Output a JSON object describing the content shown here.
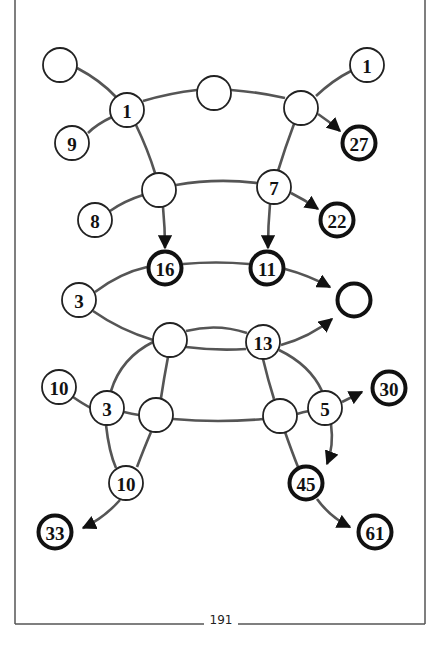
{
  "page": {
    "number": "191"
  },
  "diagram": {
    "type": "graph",
    "nodes": [
      {
        "id": "a",
        "label": "",
        "style": "normal",
        "x": 60,
        "y": 65
      },
      {
        "id": "b",
        "label": "1",
        "style": "normal",
        "x": 127,
        "y": 110
      },
      {
        "id": "c",
        "label": "",
        "style": "normal",
        "x": 214,
        "y": 93
      },
      {
        "id": "d",
        "label": "1",
        "style": "normal",
        "x": 367,
        "y": 65
      },
      {
        "id": "e",
        "label": "",
        "style": "normal",
        "x": 301,
        "y": 108
      },
      {
        "id": "f",
        "label": "27",
        "style": "bold",
        "x": 359,
        "y": 143
      },
      {
        "id": "g",
        "label": "9",
        "style": "normal",
        "x": 72,
        "y": 143
      },
      {
        "id": "h",
        "label": "",
        "style": "normal",
        "x": 159,
        "y": 190
      },
      {
        "id": "i",
        "label": "7",
        "style": "normal",
        "x": 274,
        "y": 187
      },
      {
        "id": "j",
        "label": "8",
        "style": "normal",
        "x": 95,
        "y": 220
      },
      {
        "id": "k",
        "label": "22",
        "style": "bold",
        "x": 337,
        "y": 220
      },
      {
        "id": "l",
        "label": "16",
        "style": "bold",
        "x": 165,
        "y": 268
      },
      {
        "id": "m",
        "label": "11",
        "style": "bold",
        "x": 267,
        "y": 268
      },
      {
        "id": "n",
        "label": "3",
        "style": "normal",
        "x": 79,
        "y": 300
      },
      {
        "id": "o",
        "label": "",
        "style": "bold",
        "x": 354,
        "y": 300
      },
      {
        "id": "p",
        "label": "",
        "style": "normal",
        "x": 170,
        "y": 340
      },
      {
        "id": "q",
        "label": "13",
        "style": "normal",
        "x": 263,
        "y": 342
      },
      {
        "id": "r",
        "label": "10",
        "style": "normal",
        "x": 59,
        "y": 387
      },
      {
        "id": "s",
        "label": "3",
        "style": "normal",
        "x": 107,
        "y": 408
      },
      {
        "id": "t",
        "label": "",
        "style": "normal",
        "x": 156,
        "y": 415
      },
      {
        "id": "u",
        "label": "",
        "style": "normal",
        "x": 280,
        "y": 416
      },
      {
        "id": "v",
        "label": "5",
        "style": "normal",
        "x": 325,
        "y": 408
      },
      {
        "id": "w",
        "label": "30",
        "style": "bold",
        "x": 389,
        "y": 388
      },
      {
        "id": "x",
        "label": "10",
        "style": "normal",
        "x": 126,
        "y": 483
      },
      {
        "id": "y",
        "label": "45",
        "style": "bold",
        "x": 306,
        "y": 483
      },
      {
        "id": "z",
        "label": "33",
        "style": "bold",
        "x": 55,
        "y": 532
      },
      {
        "id": "aa",
        "label": "61",
        "style": "bold",
        "x": 375,
        "y": 532
      }
    ],
    "edges": [
      {
        "from": "a",
        "to": "b",
        "directed": false
      },
      {
        "from": "b",
        "to": "g",
        "directed": false
      },
      {
        "from": "b",
        "to": "c",
        "directed": false
      },
      {
        "from": "c",
        "to": "e",
        "directed": false
      },
      {
        "from": "e",
        "to": "d",
        "directed": false
      },
      {
        "from": "e",
        "to": "f",
        "directed": true
      },
      {
        "from": "b",
        "to": "h",
        "directed": false
      },
      {
        "from": "e",
        "to": "i",
        "directed": false
      },
      {
        "from": "h",
        "to": "i",
        "directed": false
      },
      {
        "from": "h",
        "to": "j",
        "directed": false
      },
      {
        "from": "i",
        "to": "k",
        "directed": true
      },
      {
        "from": "h",
        "to": "l",
        "directed": true
      },
      {
        "from": "i",
        "to": "m",
        "directed": true
      },
      {
        "from": "n",
        "to": "l",
        "directed": false
      },
      {
        "from": "l",
        "to": "m",
        "directed": false
      },
      {
        "from": "m",
        "to": "o",
        "directed": true
      },
      {
        "from": "n",
        "to": "p",
        "directed": false
      },
      {
        "from": "p",
        "to": "q",
        "directed": false
      },
      {
        "from": "q",
        "to": "o",
        "directed": true
      },
      {
        "from": "p",
        "to": "s",
        "directed": false
      },
      {
        "from": "p",
        "to": "t",
        "directed": false
      },
      {
        "from": "q",
        "to": "u",
        "directed": false
      },
      {
        "from": "q",
        "to": "v",
        "directed": false
      },
      {
        "from": "r",
        "to": "s",
        "directed": false
      },
      {
        "from": "s",
        "to": "t",
        "directed": false
      },
      {
        "from": "t",
        "to": "u",
        "directed": false
      },
      {
        "from": "u",
        "to": "v",
        "directed": false
      },
      {
        "from": "v",
        "to": "w",
        "directed": true
      },
      {
        "from": "s",
        "to": "x",
        "directed": false
      },
      {
        "from": "t",
        "to": "x",
        "directed": false
      },
      {
        "from": "u",
        "to": "y",
        "directed": false
      },
      {
        "from": "v",
        "to": "y",
        "directed": true
      },
      {
        "from": "x",
        "to": "z",
        "directed": true
      },
      {
        "from": "y",
        "to": "aa",
        "directed": true
      }
    ]
  }
}
